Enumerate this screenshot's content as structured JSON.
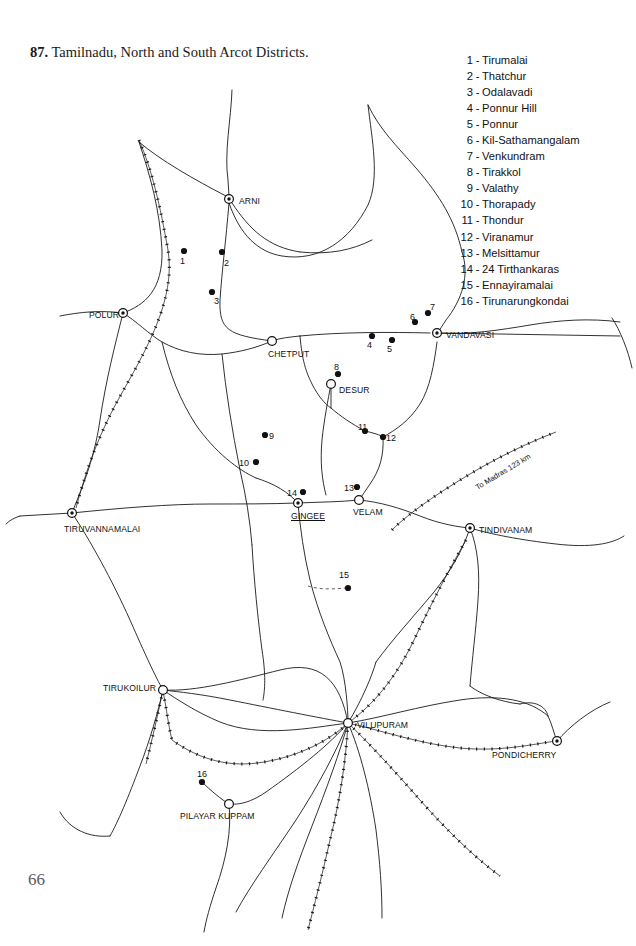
{
  "page": {
    "number": "66",
    "figure_number": "87.",
    "title": "Tamilnadu, North and South Arcot Districts."
  },
  "legend": {
    "items": [
      {
        "n": "1",
        "name": "Tirumalai"
      },
      {
        "n": "2",
        "name": "Thatchur"
      },
      {
        "n": "3",
        "name": "Odalavadi"
      },
      {
        "n": "4",
        "name": "Ponnur Hill"
      },
      {
        "n": "5",
        "name": "Ponnur"
      },
      {
        "n": "6",
        "name": "Kil-Sathamangalam"
      },
      {
        "n": "7",
        "name": "Venkundram"
      },
      {
        "n": "8",
        "name": "Tirakkol"
      },
      {
        "n": "9",
        "name": "Valathy"
      },
      {
        "n": "10",
        "name": "Thorapady"
      },
      {
        "n": "11",
        "name": "Thondur"
      },
      {
        "n": "12",
        "name": "Viranamur"
      },
      {
        "n": "13",
        "name": "Melsittamur"
      },
      {
        "n": "14",
        "name": "24 Tirthankaras"
      },
      {
        "n": "15",
        "name": "Ennayiramalai"
      },
      {
        "n": "16",
        "name": "Tirunarungkondai"
      }
    ]
  },
  "map": {
    "annotation_rail": "To Madras 123 km",
    "cities": [
      {
        "name": "ARNI",
        "x": 229,
        "y": 199,
        "marker": "dot-circle",
        "lx": 239,
        "ly": 196,
        "align": "left"
      },
      {
        "name": "POLUR",
        "x": 123,
        "y": 313,
        "marker": "dot-circle",
        "lx": 119,
        "ly": 310,
        "align": "right"
      },
      {
        "name": "CHETPUT",
        "x": 272,
        "y": 341,
        "marker": "open-circle",
        "lx": 268,
        "ly": 349,
        "align": "left"
      },
      {
        "name": "VANDAVASI",
        "x": 437,
        "y": 333,
        "marker": "dot-circle",
        "lx": 446,
        "ly": 330,
        "align": "left"
      },
      {
        "name": "DESUR",
        "x": 331,
        "y": 384,
        "marker": "open-circle",
        "lx": 339,
        "ly": 385,
        "align": "left"
      },
      {
        "name": "TIRUVANNAMALAI",
        "x": 72,
        "y": 513,
        "marker": "dot-circle",
        "lx": 64,
        "ly": 524,
        "align": "left"
      },
      {
        "name": "GINGEE",
        "x": 298,
        "y": 503,
        "marker": "dot-circle",
        "lx": 291,
        "ly": 511,
        "align": "left",
        "underline": true
      },
      {
        "name": "VELAM",
        "x": 359,
        "y": 500,
        "marker": "open-circle",
        "lx": 353,
        "ly": 507,
        "align": "left"
      },
      {
        "name": "TINDIVANAM",
        "x": 470,
        "y": 528,
        "marker": "dot-circle",
        "lx": 479,
        "ly": 525,
        "align": "left"
      },
      {
        "name": "TIRUKOILUR",
        "x": 163,
        "y": 690,
        "marker": "open-circle",
        "lx": 156,
        "ly": 683,
        "align": "right"
      },
      {
        "name": "VILUPURAM",
        "x": 348,
        "y": 723,
        "marker": "open-circle",
        "lx": 357,
        "ly": 720,
        "align": "left"
      },
      {
        "name": "PONDICHERRY",
        "x": 557,
        "y": 741,
        "marker": "dot-circle",
        "lx": 492,
        "ly": 750,
        "align": "left"
      },
      {
        "name": "PILAYAR KUPPAM",
        "x": 229,
        "y": 804,
        "marker": "open-circle",
        "lx": 180,
        "ly": 811,
        "align": "left"
      }
    ],
    "sites": [
      {
        "n": "1",
        "x": 184,
        "y": 251,
        "lx": 180,
        "ly": 256
      },
      {
        "n": "2",
        "x": 222,
        "y": 252,
        "lx": 224,
        "ly": 258
      },
      {
        "n": "3",
        "x": 212,
        "y": 292,
        "lx": 214,
        "ly": 296
      },
      {
        "n": "4",
        "x": 372,
        "y": 336,
        "lx": 367,
        "ly": 340
      },
      {
        "n": "5",
        "x": 392,
        "y": 340,
        "lx": 387,
        "ly": 344
      },
      {
        "n": "6",
        "x": 415,
        "y": 322,
        "lx": 410,
        "ly": 312
      },
      {
        "n": "7",
        "x": 428,
        "y": 313,
        "lx": 430,
        "ly": 302
      },
      {
        "n": "8",
        "x": 338,
        "y": 374,
        "lx": 334,
        "ly": 362
      },
      {
        "n": "9",
        "x": 265,
        "y": 435,
        "lx": 269,
        "ly": 431
      },
      {
        "n": "10",
        "x": 256,
        "y": 462,
        "lx": 239,
        "ly": 458
      },
      {
        "n": "11",
        "x": 365,
        "y": 431,
        "lx": 358,
        "ly": 422
      },
      {
        "n": "12",
        "x": 383,
        "y": 437,
        "lx": 386,
        "ly": 433
      },
      {
        "n": "13",
        "x": 357,
        "y": 487,
        "lx": 344,
        "ly": 483
      },
      {
        "n": "14",
        "x": 303,
        "y": 492,
        "lx": 287,
        "ly": 488
      },
      {
        "n": "15",
        "x": 348,
        "y": 588,
        "lx": 339,
        "ly": 570
      },
      {
        "n": "16",
        "x": 202,
        "y": 782,
        "lx": 197,
        "ly": 769
      }
    ],
    "colors": {
      "ink": "#111111",
      "paper": "#ffffff",
      "road": "#1a1a1a",
      "rail": "#111111"
    }
  }
}
